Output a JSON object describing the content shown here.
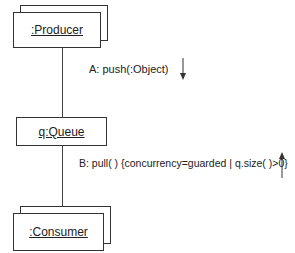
{
  "diagram": {
    "type": "UML collaboration diagram",
    "objects": [
      {
        "id": "producer",
        "label": ":Producer",
        "multi": true
      },
      {
        "id": "queue",
        "label": "q:Queue",
        "multi": false
      },
      {
        "id": "consumer",
        "label": ":Consumer",
        "multi": true
      }
    ],
    "messages": [
      {
        "id": "A",
        "label": "A: push(:Object)",
        "direction": "down"
      },
      {
        "id": "B",
        "label": "B: pull( ) {concurrency=guarded | q.size( )>0}",
        "direction": "up"
      }
    ],
    "links": [
      {
        "from": "producer",
        "to": "queue"
      },
      {
        "from": "queue",
        "to": "consumer"
      }
    ]
  }
}
